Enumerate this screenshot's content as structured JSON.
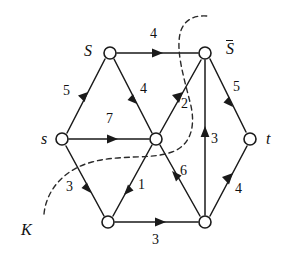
{
  "figure": {
    "background_color": "#ffffff",
    "stroke_color": "#1a1a1a",
    "width": 286,
    "height": 259
  },
  "nodes": [
    {
      "id": "S",
      "label": "S",
      "overline": false,
      "x": 110,
      "y": 53,
      "label_x": 84,
      "label_y": 43
    },
    {
      "id": "Sbar",
      "label": "S",
      "overline": true,
      "x": 205,
      "y": 53,
      "label_x": 226,
      "label_y": 40
    },
    {
      "id": "s",
      "label": "s",
      "overline": false,
      "x": 62,
      "y": 139,
      "label_x": 41,
      "label_y": 131
    },
    {
      "id": "c",
      "label": "",
      "overline": false,
      "x": 156,
      "y": 139,
      "label_x": 0,
      "label_y": 0
    },
    {
      "id": "t",
      "label": "t",
      "overline": false,
      "x": 250,
      "y": 139,
      "label_x": 266,
      "label_y": 131
    },
    {
      "id": "bl",
      "label": "",
      "overline": false,
      "x": 108,
      "y": 222,
      "label_x": 0,
      "label_y": 0
    },
    {
      "id": "br",
      "label": "",
      "overline": false,
      "x": 205,
      "y": 222,
      "label_x": 0,
      "label_y": 0
    }
  ],
  "edges": [
    {
      "from": "S",
      "to": "Sbar",
      "weight": "4",
      "label_x": 150,
      "label_y": 27
    },
    {
      "from": "s",
      "to": "S",
      "weight": "5",
      "label_x": 63,
      "label_y": 84
    },
    {
      "from": "S",
      "to": "c",
      "weight": "4",
      "label_x": 140,
      "label_y": 82
    },
    {
      "from": "s",
      "to": "c",
      "weight": "7",
      "label_x": 106,
      "label_y": 112
    },
    {
      "from": "c",
      "to": "Sbar",
      "weight": "2",
      "label_x": 181,
      "label_y": 97
    },
    {
      "from": "Sbar",
      "to": "t",
      "weight": "5",
      "label_x": 233,
      "label_y": 80
    },
    {
      "from": "br",
      "to": "Sbar",
      "weight": "3",
      "label_x": 211,
      "label_y": 132
    },
    {
      "from": "s",
      "to": "bl",
      "weight": "3",
      "label_x": 66,
      "label_y": 180
    },
    {
      "from": "c",
      "to": "bl",
      "weight": "1",
      "label_x": 138,
      "label_y": 178
    },
    {
      "from": "br",
      "to": "c",
      "weight": "6",
      "label_x": 180,
      "label_y": 164
    },
    {
      "from": "bl",
      "to": "br",
      "weight": "3",
      "label_x": 152,
      "label_y": 233
    },
    {
      "from": "br",
      "to": "t",
      "weight": "4",
      "label_x": 235,
      "label_y": 182
    }
  ],
  "cut": {
    "label": "K",
    "label_x": 21,
    "label_y": 222,
    "style": "dashed"
  }
}
